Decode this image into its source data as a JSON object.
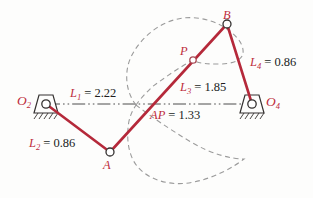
{
  "figure": {
    "kind": "fourbar-linkage-coupler-curve-diagram",
    "colors": {
      "link": "#b5293a",
      "label_red": "#bd2d3d",
      "text_black": "#211e1d",
      "coupler_curve": "#9b9b9b",
      "centerline": "#4c4c4c",
      "ground": "#343130",
      "joint_stroke": "#343130",
      "joint_stroke_red": "#a84a55",
      "joint_fill": "#ffffff"
    },
    "joints": {
      "O2": {
        "sym": "O",
        "sub": "2"
      },
      "O4": {
        "sym": "O",
        "sub": "4"
      },
      "A": {
        "sym": "A"
      },
      "B": {
        "sym": "B"
      },
      "P": {
        "sym": "P"
      }
    },
    "dimensions": {
      "L1": {
        "sym": "L",
        "sub": "1",
        "eq": "= 2.22"
      },
      "L2": {
        "sym": "L",
        "sub": "2",
        "eq": "= 0.86"
      },
      "L3": {
        "sym": "L",
        "sub": "3",
        "eq": "= 1.85"
      },
      "L4": {
        "sym": "L",
        "sub": "4",
        "eq": "= 0.86"
      },
      "AP": {
        "sym": "AP",
        "eq": "= 1.33"
      }
    }
  }
}
